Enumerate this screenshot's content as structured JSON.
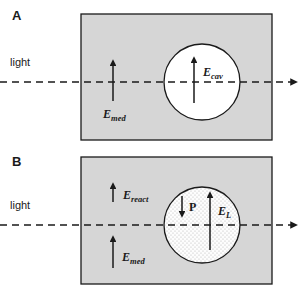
{
  "figure": {
    "type": "scientific-diagram",
    "background_color": "#ffffff",
    "medium_fill_color": "#d6d6d6",
    "cavity_fill_color": "#ffffff",
    "cavity_fill_color_b": "#fbfbfb",
    "stipple_dot_color": "#b9b9b9",
    "stroke_color": "#1a1a1a",
    "width": 300,
    "height": 292
  },
  "panels": [
    {
      "id": "A",
      "label": "A",
      "label_x": 12,
      "label_y": 20,
      "medium": {
        "x": 81,
        "y": 14,
        "width": 191,
        "height": 126,
        "fill": "#d6d6d6",
        "stippled": false
      },
      "cavity": {
        "cx": 202,
        "cy": 82,
        "r": 38,
        "fill": "#ffffff",
        "stippled": false
      },
      "light": {
        "label": "light",
        "label_x": 10,
        "label_y": 66,
        "ray_y": 82,
        "ray_x_start": 0,
        "ray_x_end": 291,
        "dashed": true,
        "arrowhead": true
      },
      "field_arrows": [
        {
          "name": "E_med",
          "label": "E",
          "subscript": "med",
          "x": 113,
          "y_tail": 101,
          "y_head": 61,
          "direction": "up",
          "label_x": 103,
          "label_y": 118,
          "label_anchor": "start"
        },
        {
          "name": "E_cav",
          "label": "E",
          "subscript": "cav",
          "x": 194,
          "y_tail": 103,
          "y_head": 58,
          "direction": "up",
          "label_x": 203,
          "label_y": 76,
          "label_anchor": "start"
        }
      ]
    },
    {
      "id": "B",
      "label": "B",
      "label_x": 12,
      "label_y": 166,
      "medium": {
        "x": 81,
        "y": 157,
        "width": 191,
        "height": 127,
        "fill": "#d6d6d6",
        "stippled": false
      },
      "cavity": {
        "cx": 202,
        "cy": 225,
        "r": 38,
        "fill": "#fbfbfb",
        "stippled": true
      },
      "light": {
        "label": "light",
        "label_x": 10,
        "label_y": 209,
        "ray_y": 225,
        "ray_x_start": 0,
        "ray_x_end": 291,
        "dashed": true,
        "arrowhead": true
      },
      "field_arrows": [
        {
          "name": "E_react",
          "label": "E",
          "subscript": "react",
          "x": 113,
          "y_tail": 202,
          "y_head": 184,
          "direction": "up",
          "label_x": 123,
          "label_y": 199,
          "label_anchor": "start"
        },
        {
          "name": "E_med",
          "label": "E",
          "subscript": "med",
          "x": 113,
          "y_tail": 268,
          "y_head": 237,
          "direction": "up",
          "label_x": 122,
          "label_y": 261,
          "label_anchor": "start"
        },
        {
          "name": "P",
          "label": "P",
          "subscript": "",
          "x": 182,
          "y_tail": 196,
          "y_head": 216,
          "direction": "down",
          "label_x": 189,
          "label_y": 211,
          "label_anchor": "start"
        },
        {
          "name": "E_L",
          "label": "E",
          "subscript": "L",
          "x": 210,
          "y_tail": 250,
          "y_head": 193,
          "direction": "up",
          "label_x": 218,
          "label_y": 215,
          "label_anchor": "start"
        }
      ]
    }
  ]
}
